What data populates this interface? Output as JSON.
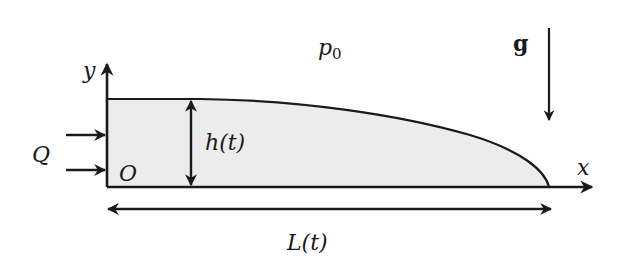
{
  "figure": {
    "type": "gravity current schematic",
    "colors": {
      "stroke": "#1a1a1a",
      "fluid_fill": "#ececec",
      "background": "#ffffff"
    }
  },
  "labels": {
    "y_axis": "y",
    "x_axis": "x",
    "origin": "O",
    "inflow": "Q",
    "height": "h(t)",
    "length": "L(t)",
    "ambient_pressure": "p",
    "ambient_pressure_sub": "0",
    "gravity": "g"
  }
}
